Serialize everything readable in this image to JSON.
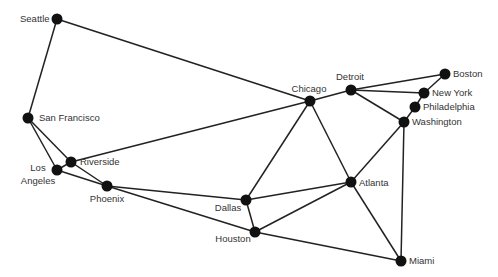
{
  "diagram": {
    "type": "graph",
    "nodes": [
      {
        "id": "seattle",
        "label": "Seattle",
        "x": 57,
        "y": 19,
        "lx": 20,
        "ly": 22,
        "anchor": "start"
      },
      {
        "id": "sf",
        "label": "San Francisco",
        "x": 28,
        "y": 118,
        "lx": 39,
        "ly": 121,
        "anchor": "start"
      },
      {
        "id": "la",
        "label": "Los",
        "label2": "Angeles",
        "x": 57,
        "y": 170,
        "lx": 38,
        "ly": 171,
        "anchor": "middle"
      },
      {
        "id": "riverside",
        "label": "Riverside",
        "x": 71,
        "y": 162,
        "lx": 80,
        "ly": 165,
        "anchor": "start"
      },
      {
        "id": "phoenix",
        "label": "Phoenix",
        "x": 107,
        "y": 186,
        "lx": 107,
        "ly": 202,
        "anchor": "middle"
      },
      {
        "id": "dallas",
        "label": "Dallas",
        "x": 246,
        "y": 200,
        "lx": 228,
        "ly": 211,
        "anchor": "middle"
      },
      {
        "id": "houston",
        "label": "Houston",
        "x": 255,
        "y": 232,
        "lx": 233,
        "ly": 242,
        "anchor": "middle"
      },
      {
        "id": "chicago",
        "label": "Chicago",
        "x": 310,
        "y": 101,
        "lx": 309,
        "ly": 92,
        "anchor": "middle"
      },
      {
        "id": "detroit",
        "label": "Detroit",
        "x": 351,
        "y": 90,
        "lx": 350,
        "ly": 80,
        "anchor": "middle"
      },
      {
        "id": "boston",
        "label": "Boston",
        "x": 445,
        "y": 74,
        "lx": 453,
        "ly": 77,
        "anchor": "start"
      },
      {
        "id": "newyork",
        "label": "New York",
        "x": 424,
        "y": 93,
        "lx": 432,
        "ly": 96,
        "anchor": "start"
      },
      {
        "id": "philadelphia",
        "label": "Philadelphia",
        "x": 415,
        "y": 107,
        "lx": 423,
        "ly": 110,
        "anchor": "start"
      },
      {
        "id": "washington",
        "label": "Washington",
        "x": 404,
        "y": 122,
        "lx": 412,
        "ly": 125,
        "anchor": "start"
      },
      {
        "id": "atlanta",
        "label": "Atlanta",
        "x": 351,
        "y": 182,
        "lx": 359,
        "ly": 186,
        "anchor": "start"
      },
      {
        "id": "miami",
        "label": "Miami",
        "x": 401,
        "y": 261,
        "lx": 409,
        "ly": 264,
        "anchor": "start"
      }
    ],
    "edges": [
      [
        "seattle",
        "sf"
      ],
      [
        "seattle",
        "chicago"
      ],
      [
        "sf",
        "la"
      ],
      [
        "sf",
        "riverside"
      ],
      [
        "la",
        "riverside"
      ],
      [
        "la",
        "phoenix"
      ],
      [
        "riverside",
        "phoenix"
      ],
      [
        "riverside",
        "chicago"
      ],
      [
        "phoenix",
        "dallas"
      ],
      [
        "phoenix",
        "houston"
      ],
      [
        "dallas",
        "chicago"
      ],
      [
        "dallas",
        "atlanta"
      ],
      [
        "dallas",
        "houston"
      ],
      [
        "houston",
        "atlanta"
      ],
      [
        "houston",
        "miami"
      ],
      [
        "chicago",
        "detroit"
      ],
      [
        "chicago",
        "atlanta"
      ],
      [
        "detroit",
        "boston"
      ],
      [
        "detroit",
        "newyork"
      ],
      [
        "detroit",
        "washington"
      ],
      [
        "boston",
        "newyork"
      ],
      [
        "newyork",
        "philadelphia"
      ],
      [
        "philadelphia",
        "washington"
      ],
      [
        "washington",
        "atlanta"
      ],
      [
        "washington",
        "miami"
      ],
      [
        "atlanta",
        "miami"
      ]
    ],
    "colors": {
      "node": "#111111",
      "edge": "#222222",
      "label": "#333333"
    }
  }
}
